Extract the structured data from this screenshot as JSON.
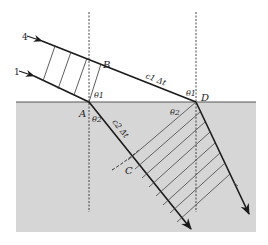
{
  "diagram": {
    "colors": {
      "background": "#ffffff",
      "medium2": "#d6d6d6",
      "line": "#1a1a1a",
      "hatch": "#444444"
    },
    "rays": {
      "ray_top_label": "4",
      "ray_bottom_label": "1"
    },
    "points": {
      "A": "A",
      "B": "B",
      "C": "C",
      "D": "D"
    },
    "angles": {
      "theta1_at_A": "θ1",
      "theta2_at_A": "θ2",
      "theta1_at_D": "θ1",
      "theta2_at_D": "θ2"
    },
    "segments": {
      "BD_label": "c1 Δt",
      "AC_label": "c2 Δt"
    }
  }
}
